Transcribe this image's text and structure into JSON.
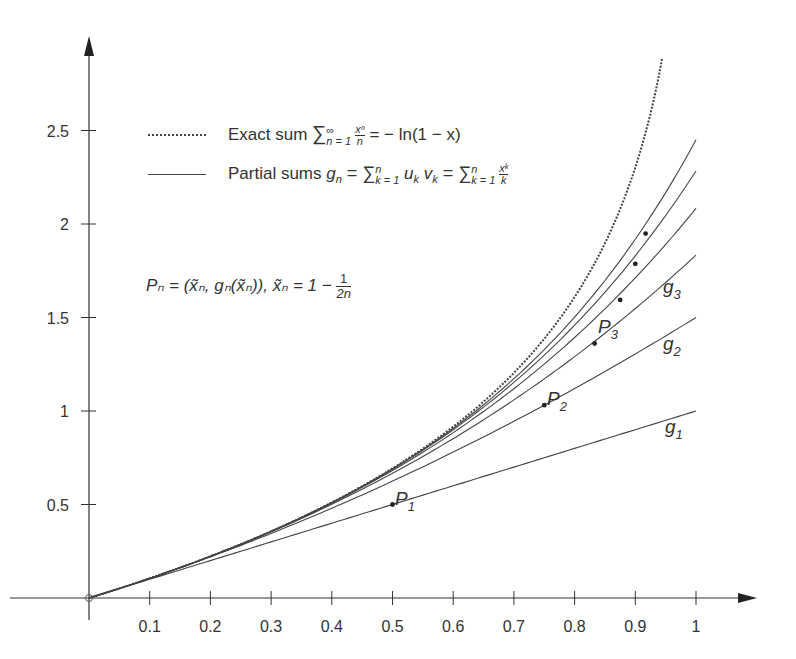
{
  "chart_data": {
    "type": "line",
    "title": "",
    "xlabel": "",
    "ylabel": "",
    "xlim": [
      0,
      1.07
    ],
    "ylim": [
      0,
      2.85
    ],
    "grid": false,
    "legend_position": "upper-left (inside)",
    "x_ticks": [
      "0.1",
      "0.2",
      "0.3",
      "0.4",
      "0.5",
      "0.6",
      "0.7",
      "0.8",
      "0.9",
      "1"
    ],
    "y_ticks": [
      "0.5",
      "1",
      "1.5",
      "2",
      "2.5"
    ],
    "legend": [
      {
        "style": "dashed",
        "label": "Exact sum ∑_{n=1}^{∞} x^n/n = −ln(1−x)"
      },
      {
        "style": "solid",
        "label": "Partial sums g_n = ∑_{k=1}^{n} u_k v_k = ∑_{k=1}^{n} x^k/k"
      }
    ],
    "annotation": "P_n = (x̃_n, g_n(x̃_n)), x̃_n = 1 − 1/(2n)",
    "series": [
      {
        "name": "exact: -ln(1-x)",
        "style": "dashed",
        "x": [
          0,
          0.1,
          0.2,
          0.3,
          0.4,
          0.5,
          0.6,
          0.7,
          0.8,
          0.9,
          0.94
        ],
        "values": [
          0,
          0.105,
          0.223,
          0.357,
          0.511,
          0.693,
          0.916,
          1.204,
          1.609,
          2.303,
          2.813
        ]
      },
      {
        "name": "g1",
        "style": "solid",
        "x": [
          0,
          0.5,
          1
        ],
        "values": [
          0,
          0.5,
          1.0
        ]
      },
      {
        "name": "g2",
        "style": "solid",
        "x": [
          0,
          0.25,
          0.5,
          0.75,
          1
        ],
        "values": [
          0,
          0.281,
          0.625,
          1.031,
          1.5
        ]
      },
      {
        "name": "g3",
        "style": "solid",
        "x": [
          0,
          0.25,
          0.5,
          0.75,
          0.833,
          1
        ],
        "values": [
          0,
          0.286,
          0.667,
          1.172,
          1.361,
          1.833
        ]
      },
      {
        "name": "g4",
        "style": "solid",
        "x": [
          0,
          0.5,
          0.875,
          1
        ],
        "values": [
          0,
          0.682,
          1.594,
          2.083
        ]
      },
      {
        "name": "g5",
        "style": "solid",
        "x": [
          0,
          0.5,
          0.9,
          1
        ],
        "values": [
          0,
          0.689,
          1.787,
          2.283
        ]
      },
      {
        "name": "g6",
        "style": "solid",
        "x": [
          0,
          0.5,
          0.917,
          1
        ],
        "values": [
          0,
          0.691,
          1.949,
          2.45
        ]
      }
    ],
    "points": [
      {
        "label": "P1",
        "x": 0.5,
        "y": 0.5
      },
      {
        "label": "P2",
        "x": 0.75,
        "y": 1.031
      },
      {
        "label": "P3",
        "x": 0.833,
        "y": 1.361
      },
      {
        "label": "P4",
        "x": 0.875,
        "y": 1.594
      },
      {
        "label": "P5",
        "x": 0.9,
        "y": 1.787
      },
      {
        "label": "P6",
        "x": 0.917,
        "y": 1.949
      }
    ],
    "curve_labels": [
      "g1",
      "g2",
      "g3"
    ]
  },
  "legend": {
    "exact": {
      "prefix": "Exact sum ",
      "sum": "∑",
      "sup": "∞",
      "sub": "n = 1",
      "frac_num": "xⁿ",
      "frac_den": "n",
      "rest": " = − ln(1 − x)"
    },
    "partial": {
      "prefix": "Partial sums ",
      "g": "g",
      "g_sub": "n",
      "mid": " = ∑",
      "sup1": "n",
      "sub1": "k = 1",
      "uv": " u",
      "uv_sub1": "k",
      "v": " v",
      "uv_sub2": "k",
      "eq2": " = ∑",
      "sup2": "n",
      "sub2": "k = 1",
      "frac_num": "xᵏ",
      "frac_den": "k"
    }
  },
  "formula": {
    "text": "Pₙ = (x̃ₙ, gₙ(x̃ₙ)), x̃ₙ = 1 − ",
    "frac_num": "1",
    "frac_den": "2n"
  },
  "labels": {
    "P1": "P",
    "P1_sub": "1",
    "P2": "P",
    "P2_sub": "2",
    "P3": "P",
    "P3_sub": "3",
    "g1": "g",
    "g1_sub": "1",
    "g2": "g",
    "g2_sub": "2",
    "g3": "g",
    "g3_sub": "3"
  }
}
